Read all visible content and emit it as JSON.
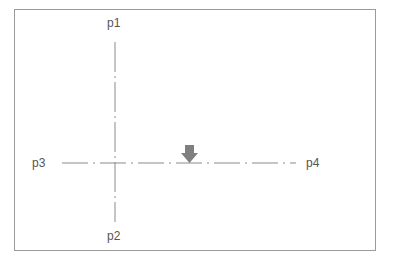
{
  "diagram": {
    "points": {
      "p1": {
        "label": "p1"
      },
      "p2": {
        "label": "p2"
      },
      "p3": {
        "label": "p3"
      },
      "p4": {
        "label": "p4"
      }
    },
    "colors": {
      "border": "#9a9a9a",
      "line": "#8a8a8a",
      "arrow": "#7f7f7f",
      "text": "#555555"
    },
    "arrow": {
      "direction": "down"
    }
  }
}
